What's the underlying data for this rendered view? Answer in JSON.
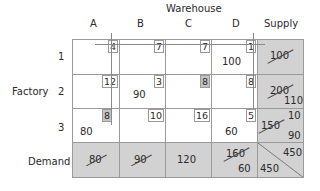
{
  "title": "Warehouse",
  "row_group_label": "Factory",
  "columns": [
    "A",
    "B",
    "C",
    "D"
  ],
  "supply_header": "Supply",
  "demand_label": "Demand",
  "rows": [
    {
      "label": "1",
      "costs": [
        "4",
        "7",
        "7",
        "1"
      ],
      "allocations": [
        "",
        "",
        "",
        "100"
      ],
      "highlight": [
        false,
        false,
        false,
        false
      ]
    },
    {
      "label": "2",
      "costs": [
        "12",
        "3",
        "8",
        "8"
      ],
      "allocations": [
        "",
        "90",
        "",
        ""
      ],
      "highlight": [
        false,
        false,
        true,
        false
      ]
    },
    {
      "label": "3",
      "costs": [
        "8",
        "10",
        "16",
        "5"
      ],
      "allocations": [
        "80",
        "",
        "",
        "60"
      ],
      "highlight": [
        true,
        false,
        false,
        false
      ]
    }
  ],
  "supply": [
    {
      "original": "100",
      "crossed": true,
      "remaining": []
    },
    {
      "original": "200",
      "crossed": true,
      "remaining": [
        "110"
      ]
    },
    {
      "original": "150",
      "crossed": true,
      "remaining": [
        "10",
        "90"
      ]
    }
  ],
  "demand": [
    {
      "original": "80",
      "crossed": true,
      "remaining": ""
    },
    {
      "original": "90",
      "crossed": true,
      "remaining": ""
    },
    {
      "original": "120",
      "crossed": false,
      "remaining": ""
    },
    {
      "original": "160",
      "crossed": true,
      "remaining": "60"
    }
  ],
  "totals": {
    "supply_total": "450",
    "demand_total": "450"
  },
  "colors": {
    "shade": "#d2d2d2",
    "highlight": "#c4c4c4",
    "grid": "#9a9a9a"
  }
}
